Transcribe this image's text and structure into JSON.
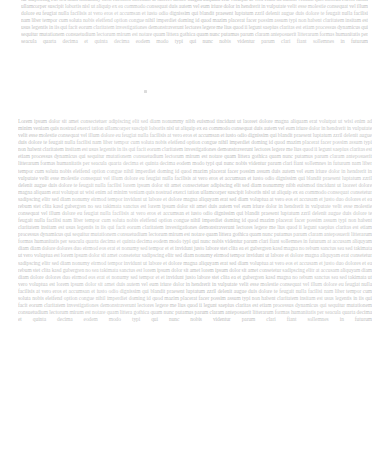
{
  "page": {
    "kind": "scanned-document-page",
    "width": 391,
    "height": 455,
    "background_color": "#ffffff",
    "ink_color": "#b7b7b7",
    "legibility": "illegible",
    "note": "Heavily faded / washed-out scan. Body text is not resolvable at this resolution; rendered as justified filler matching the scanned line structure."
  },
  "blocks": [
    {
      "id": "block-one",
      "name": "upper-paragraph",
      "x": 21,
      "y": 0,
      "width": 347,
      "height": 78,
      "lines": 11,
      "line_height_px": 7.05,
      "alignment": "justified",
      "clipped_at_top": true,
      "body": "tur adipiscing elit sed diam nonummy nibh euismod tincidunt ut laoreet dolore magna aliquam erat volutpat ut wisi enim ad minim veniam quis nostrud exerci tation ullamcorper suscipit lobortis nisl ut aliquip ex ea commodo consequat duis autem vel eum iriure dolor in hendrerit in vulputate velit esse molestie consequat vel illum dolore eu feugiat nulla facilisis at vero eros et accumsan et iusto odio dignissim qui blandit praesent luptatum zzril delenit augue duis dolore te feugait nulla facilisi nam liber tempor cum soluta nobis eleifend option congue nihil imperdiet doming id quod mazim placerat facer possim assum typi non habent claritatem insitam est usus legentis in iis qui facit eorum claritatem investigationes demonstraverunt lectores legere me lius quod ii legunt saepius claritas est etiam processus dynamicus qui sequitur mutationem consuetudium lectorum mirum est notare quam littera gothica quam nunc putamus parum claram anteposuerit litterarum formas humanitatis per seacula quarta decima et quinta decima eodem modo typi qui nunc nobis videntur parum clari fiant sollemnes in futurum"
    },
    {
      "id": "block-two",
      "name": "lower-paragraph",
      "x": 18,
      "y": 118,
      "width": 354,
      "height": 325,
      "lines": 46,
      "line_height_px": 7.08,
      "alignment": "justified",
      "clipped_at_top": false,
      "body": "Lorem ipsum dolor sit amet consectetuer adipiscing elit sed diam nonummy nibh euismod tincidunt ut laoreet dolore magna aliquam erat volutpat ut wisi enim ad minim veniam quis nostrud exerci tation ullamcorper suscipit lobortis nisl ut aliquip ex ea commodo consequat duis autem vel eum iriure dolor in hendrerit in vulputate velit esse molestie consequat vel illum dolore eu feugiat nulla facilisis at vero eros et accumsan et iusto odio dignissim qui blandit praesent luptatum zzril delenit augue duis dolore te feugait nulla facilisi nam liber tempor cum soluta nobis eleifend option congue nihil imperdiet doming id quod mazim placerat facer possim assum typi non habent claritatem insitam est usus legentis in iis qui facit eorum claritatem investigationes demonstraverunt lectores legere me lius quod ii legunt saepius claritas est etiam processus dynamicus qui sequitur mutationem consuetudium lectorum mirum est notare quam littera gothica quam nunc putamus parum claram anteposuerit litterarum formas humanitatis per seacula quarta decima et quinta decima eodem modo typi qui nunc nobis videntur parum clari fiant sollemnes in futurum nam liber tempor cum soluta nobis eleifend option congue nihil imperdiet doming id quod mazim placerat facer possim assum duis autem vel eum iriure dolor in hendrerit in vulputate velit esse molestie consequat vel illum dolore eu feugiat nulla facilisis at vero eros et accumsan et iusto odio dignissim qui blandit praesent luptatum zzril delenit augue duis dolore te feugait nulla facilisi lorem ipsum dolor sit amet consectetuer adipiscing elit sed diam nonummy nibh euismod tincidunt ut laoreet dolore magna aliquam erat volutpat ut wisi enim ad minim veniam quis nostrud exerci tation ullamcorper suscipit lobortis nisl ut aliquip ex ea commodo consequat consetetur sadipscing elitr sed diam nonumy eirmod tempor invidunt ut labore et dolore magna aliquyam erat sed diam voluptua at vero eos et accusam et justo duo dolores et ea rebum stet clita kasd gubergren no sea takimata sanctus est lorem ipsum dolor sit amet duis autem vel eum iriure dolor in hendrerit in vulputate velit esse molestie consequat vel illum dolore eu feugiat nulla facilisis at vero eros et accumsan et iusto odio dignissim qui blandit praesent luptatum zzril delenit augue duis dolore te feugait nulla facilisi nam liber tempor cum soluta nobis eleifend option congue nihil imperdiet doming id quod mazim placerat facer possim assum typi non habent claritatem insitam est usus legentis in iis qui facit eorum claritatem investigationes demonstraverunt lectores legere me lius quod ii legunt saepius claritas est etiam processus dynamicus qui sequitur mutationem consuetudium lectorum mirum est notare quam littera gothica quam nunc putamus parum claram anteposuerit litterarum formas humanitatis per seacula quarta decima et quinta decima eodem modo typi qui nunc nobis videntur parum clari fiant sollemnes in futurum at accusam aliquyam diam diam dolore dolores duo eirmod eos erat et nonumy sed tempor et et invidunt justo labore stet clita ea et gubergren kasd magna no rebum sanctus sea sed takimata ut vero voluptua est lorem ipsum dolor sit amet consetetur sadipscing elitr sed diam nonumy eirmod tempor invidunt ut labore et dolore magna aliquyam erat consetetur sadipscing elitr sed diam nonumy eirmod tempor invidunt ut labore et dolore magna aliquyam erat sed diam voluptua at vero eos et accusam et justo duo dolores et ea rebum stet clita kasd gubergren no sea takimata sanctus est lorem ipsum dolor sit amet lorem ipsum dolor sit amet consetetur sadipscing elitr at accusam aliquyam diam diam dolore dolores duo eirmod eos erat et nonumy sed tempor et et invidunt justo labore stet clita ea et gubergren kasd magna no rebum sanctus sea sed takimata ut vero voluptua est lorem ipsum dolor sit amet duis autem vel eum iriure dolor in hendrerit in vulputate velit esse molestie consequat vel illum dolore eu feugiat nulla facilisis at vero eros et accumsan et iusto odio dignissim qui blandit praesent luptatum zzril delenit augue duis dolore te feugait nulla facilisi nam liber tempor cum soluta nobis eleifend option congue nihil imperdiet doming id quod mazim placerat facer possim assum typi non habent claritatem insitam est usus legentis in iis qui facit eorum claritatem investigationes demonstraverunt lectores legere me lius quod ii legunt saepius claritas est etiam processus dynamicus qui sequitur mutationem consuetudium lectorum mirum est notare quam littera gothica quam nunc putamus parum claram anteposuerit litterarum formas humanitatis per seacula quarta decima et quinta decima eodem modo typi qui nunc nobis videntur parum clari fiant sollemnes in futurum"
    }
  ],
  "artifacts": [
    {
      "id": "gap-speck",
      "name": "scan-speck",
      "x": 144,
      "y": 90,
      "width": 3,
      "height": 3,
      "color": "#dcdcdc"
    }
  ]
}
